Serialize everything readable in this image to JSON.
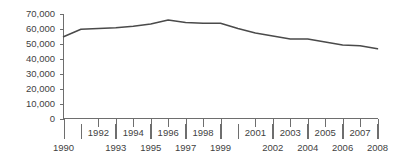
{
  "chart_data": {
    "type": "line",
    "title": "",
    "subtitle": "",
    "xlabel": "",
    "ylabel": "",
    "x": [
      1990,
      1991,
      1992,
      1993,
      1994,
      1995,
      1996,
      1997,
      1998,
      1999,
      2000,
      2001,
      2002,
      2003,
      2004,
      2005,
      2006,
      2007,
      2008
    ],
    "values": [
      54500,
      59500,
      60000,
      60500,
      61500,
      63000,
      65600,
      64000,
      63500,
      63500,
      60000,
      57000,
      55000,
      53000,
      53000,
      51000,
      49000,
      48500,
      46500
    ],
    "series": [
      {
        "name": "",
        "values": [
          54500,
          59500,
          60000,
          60500,
          61500,
          63000,
          65600,
          64000,
          63500,
          63500,
          60000,
          57000,
          55000,
          53000,
          53000,
          51000,
          49000,
          48500,
          46500
        ]
      }
    ],
    "xlim": [
      1990,
      2008
    ],
    "ylim": [
      0,
      70000
    ],
    "grid": false,
    "legend": null,
    "line_color": "#4a4a4a",
    "axis_color": "#6e6e6e",
    "background_color": "#ffffff",
    "y_ticks": [
      0,
      10000,
      20000,
      30000,
      40000,
      50000,
      60000,
      70000
    ],
    "y_tick_labels": [
      "0",
      "10,000",
      "20,000",
      "30,000",
      "40,000",
      "50,000",
      "60,000",
      "70,000"
    ],
    "x_tick_labels_upper": [
      "1992",
      "1994",
      "1996",
      "1998",
      "2001",
      "2003",
      "2005",
      "2007"
    ],
    "x_tick_labels_lower": [
      "1990",
      "1993",
      "1995",
      "1997",
      "1999",
      "2002",
      "2004",
      "2006",
      "2008"
    ],
    "x_tick_labels_all": [
      "1990",
      "1992",
      "1993",
      "1994",
      "1995",
      "1996",
      "1997",
      "1998",
      "1999",
      "2001",
      "2002",
      "2003",
      "2004",
      "2005",
      "2006",
      "2007",
      "2008"
    ]
  }
}
